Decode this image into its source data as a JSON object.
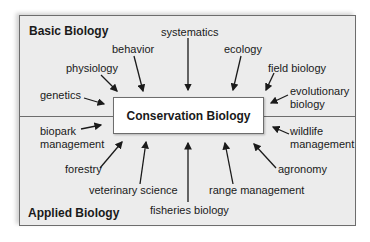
{
  "diagram": {
    "center": "Conservation Biology",
    "sections": {
      "top": "Basic Biology",
      "bottom": "Applied Biology"
    },
    "basic_fields": [
      {
        "label": "genetics",
        "x": 40,
        "y": 94
      },
      {
        "label": "physiology",
        "x": 66,
        "y": 63
      },
      {
        "label": "behavior",
        "x": 112,
        "y": 44
      },
      {
        "label": "systematics",
        "x": 162,
        "y": 27
      },
      {
        "label": "ecology",
        "x": 223,
        "y": 44
      },
      {
        "label": "field biology",
        "x": 268,
        "y": 63
      },
      {
        "label": "evolutionary",
        "x": 290,
        "y": 86
      },
      {
        "label": "biology",
        "x": 290,
        "y": 99
      }
    ],
    "applied_fields": [
      {
        "label": "biopark",
        "x": 40,
        "y": 126
      },
      {
        "label": "management",
        "x": 40,
        "y": 139
      },
      {
        "label": "forestry",
        "x": 65,
        "y": 163
      },
      {
        "label": "veterinary science",
        "x": 89,
        "y": 184
      },
      {
        "label": "fisheries biology",
        "x": 150,
        "y": 204
      },
      {
        "label": "range management",
        "x": 209,
        "y": 184
      },
      {
        "label": "agronomy",
        "x": 278,
        "y": 163
      },
      {
        "label": "wildlife",
        "x": 290,
        "y": 126
      },
      {
        "label": "management",
        "x": 290,
        "y": 139
      }
    ],
    "colors": {
      "frame_bg": "#ececec",
      "border": "#6d6d6d",
      "text": "#1a1a1a",
      "box_bg": "#ffffff"
    }
  }
}
